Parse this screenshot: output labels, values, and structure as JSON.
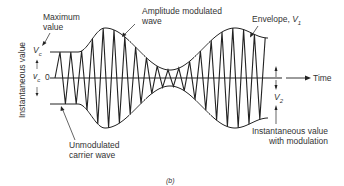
{
  "figure": {
    "caption": "(b)",
    "y_axis_label": "Instantaneous value",
    "x_axis_label": "Time",
    "zero_label": "0",
    "labels": {
      "maximum_value": [
        "Maximum",
        "value"
      ],
      "vc_max": "V",
      "vc_max_sub": "c",
      "vc_inst": "v",
      "vc_inst_sub": "c",
      "am_wave": [
        "Amplitude modulated",
        "wave"
      ],
      "envelope": "Envelope, ",
      "envelope_var": "V",
      "envelope_sub": "1",
      "v2": "V",
      "v2_sub": "2",
      "inst_mod": [
        "Instantaneous value",
        "with modulation"
      ],
      "unmod_carrier": [
        "Unmodulated",
        "carrier wave"
      ]
    },
    "colors": {
      "line": "#222222",
      "text": "#333333",
      "background": "#ffffff"
    }
  }
}
